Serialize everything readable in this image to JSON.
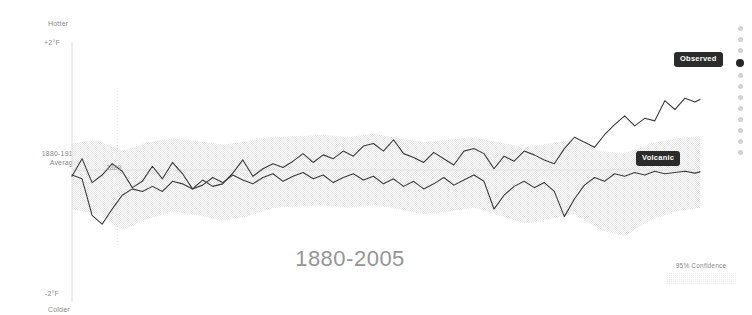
{
  "axis": {
    "top_label": "Hotter",
    "top_value": "+2°F",
    "baseline_label": "1880-1910\nAverage",
    "baseline_label_line1": "1880-1910",
    "baseline_label_line2": "Average",
    "bottom_value": "-2°F",
    "bottom_label": "Colder"
  },
  "annotations": {
    "year_marker": "1889"
  },
  "series_labels": {
    "observed": "Observed",
    "volcanic": "Volcanic"
  },
  "title": "1880-2005",
  "legend": {
    "confidence_label": "95% Confidence"
  },
  "nav": {
    "active_index": 3,
    "dot_count": 12
  },
  "colors": {
    "line": "#3a3a3a",
    "band": "#ececec",
    "axis": "#d8d8d8",
    "title": "#959595",
    "pill_bg": "#2b2b2b",
    "pill_text": "#ffffff",
    "dot_inactive": "#d2d2d2",
    "dot_active": "#262626"
  },
  "chart_data": {
    "type": "line",
    "title": "1880-2005",
    "xlabel": "",
    "ylabel": "Temperature anomaly vs 1880-1910 average (°F)",
    "ylim": [
      -2,
      2
    ],
    "yticks": [
      2,
      0,
      -2
    ],
    "ytick_labels": [
      "+2°F",
      "1880-1910 Average",
      "-2°F"
    ],
    "xlim": [
      1880,
      2005
    ],
    "grid": false,
    "legend_position": "inline-right",
    "annotations": [
      {
        "label": "1889",
        "x": 1889,
        "type": "vertical-gridline"
      }
    ],
    "band": {
      "name": "95% Confidence",
      "x": [
        1880,
        1885,
        1890,
        1895,
        1900,
        1905,
        1910,
        1915,
        1920,
        1925,
        1930,
        1935,
        1940,
        1945,
        1950,
        1955,
        1960,
        1965,
        1970,
        1975,
        1980,
        1985,
        1990,
        1995,
        2000,
        2005
      ],
      "lower": [
        -0.62,
        -0.7,
        -0.95,
        -0.78,
        -0.66,
        -0.72,
        -0.8,
        -0.74,
        -0.6,
        -0.58,
        -0.56,
        -0.6,
        -0.55,
        -0.62,
        -0.7,
        -0.66,
        -0.6,
        -0.72,
        -0.85,
        -0.78,
        -0.7,
        -0.95,
        -1.05,
        -0.8,
        -0.66,
        -0.6
      ],
      "upper": [
        0.42,
        0.48,
        0.3,
        0.44,
        0.5,
        0.46,
        0.4,
        0.46,
        0.52,
        0.54,
        0.56,
        0.52,
        0.58,
        0.5,
        0.44,
        0.48,
        0.52,
        0.44,
        0.36,
        0.42,
        0.48,
        0.3,
        0.26,
        0.42,
        0.5,
        0.54
      ]
    },
    "series": [
      {
        "name": "Observed",
        "x": [
          1880,
          1882,
          1884,
          1886,
          1888,
          1890,
          1892,
          1894,
          1896,
          1898,
          1900,
          1902,
          1904,
          1906,
          1908,
          1910,
          1912,
          1914,
          1916,
          1918,
          1920,
          1922,
          1924,
          1926,
          1928,
          1930,
          1932,
          1934,
          1936,
          1938,
          1940,
          1942,
          1944,
          1946,
          1948,
          1950,
          1952,
          1954,
          1956,
          1958,
          1960,
          1962,
          1964,
          1966,
          1968,
          1970,
          1972,
          1974,
          1976,
          1978,
          1980,
          1982,
          1984,
          1986,
          1988,
          1990,
          1992,
          1994,
          1996,
          1998,
          2000,
          2002,
          2004,
          2005
        ],
        "values": [
          -0.1,
          0.18,
          -0.2,
          -0.08,
          0.1,
          -0.02,
          -0.28,
          -0.18,
          0.06,
          -0.14,
          0.12,
          -0.06,
          -0.3,
          -0.16,
          -0.26,
          -0.22,
          -0.05,
          0.16,
          -0.1,
          0.02,
          0.1,
          0.04,
          0.14,
          0.26,
          0.12,
          0.24,
          0.18,
          0.3,
          0.22,
          0.38,
          0.42,
          0.3,
          0.48,
          0.26,
          0.2,
          0.12,
          0.28,
          0.18,
          0.08,
          0.3,
          0.34,
          0.26,
          0.02,
          0.22,
          0.14,
          0.3,
          0.24,
          0.16,
          0.1,
          0.34,
          0.52,
          0.44,
          0.36,
          0.56,
          0.72,
          0.86,
          0.7,
          0.82,
          0.78,
          1.1,
          0.96,
          1.14,
          1.08,
          1.12
        ]
      },
      {
        "name": "Volcanic",
        "x": [
          1880,
          1882,
          1884,
          1886,
          1888,
          1890,
          1892,
          1894,
          1896,
          1898,
          1900,
          1902,
          1904,
          1906,
          1908,
          1910,
          1912,
          1914,
          1916,
          1918,
          1920,
          1922,
          1924,
          1926,
          1928,
          1930,
          1932,
          1934,
          1936,
          1938,
          1940,
          1942,
          1944,
          1946,
          1948,
          1950,
          1952,
          1954,
          1956,
          1958,
          1960,
          1962,
          1964,
          1966,
          1968,
          1970,
          1972,
          1974,
          1976,
          1978,
          1980,
          1982,
          1984,
          1986,
          1988,
          1990,
          1992,
          1994,
          1996,
          1998,
          2000,
          2002,
          2004,
          2005
        ],
        "values": [
          -0.08,
          -0.14,
          -0.72,
          -0.86,
          -0.62,
          -0.4,
          -0.3,
          -0.34,
          -0.26,
          -0.34,
          -0.18,
          -0.22,
          -0.3,
          -0.24,
          -0.12,
          -0.2,
          -0.08,
          -0.16,
          -0.22,
          -0.12,
          -0.06,
          -0.18,
          -0.1,
          -0.04,
          -0.14,
          -0.08,
          -0.2,
          -0.12,
          -0.06,
          -0.16,
          -0.1,
          -0.22,
          -0.14,
          -0.26,
          -0.18,
          -0.3,
          -0.22,
          -0.12,
          -0.24,
          -0.16,
          -0.08,
          -0.18,
          -0.62,
          -0.4,
          -0.26,
          -0.18,
          -0.28,
          -0.2,
          -0.34,
          -0.74,
          -0.46,
          -0.24,
          -0.12,
          -0.18,
          -0.06,
          -0.1,
          -0.04,
          -0.08,
          -0.02,
          -0.06,
          -0.04,
          -0.02,
          -0.05,
          -0.03
        ]
      }
    ]
  }
}
